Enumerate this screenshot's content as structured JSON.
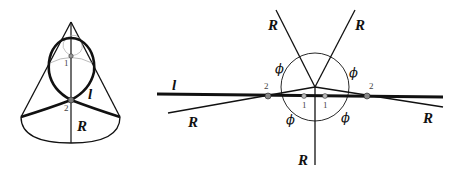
{
  "cone_figure": {
    "labels": {
      "R": "R",
      "l": "l",
      "point_1": "1",
      "point_2": "2"
    }
  },
  "unfolded_figure": {
    "labels": {
      "l": "l",
      "R_upper_left": "R",
      "R_upper_right": "R",
      "R_lower_left": "R",
      "R_lower_right": "R",
      "R_bottom": "R",
      "phi_upper_left": "ϕ",
      "phi_upper_right": "ϕ",
      "phi_lower_left": "ϕ",
      "phi_lower_right": "ϕ",
      "point_2_left": "2",
      "point_1_left": "1",
      "point_1_right": "1",
      "point_2_right": "2"
    }
  },
  "colors": {
    "stroke": "#111111",
    "point_fill": "#999999",
    "thin_curve": "#aaaaaa"
  }
}
